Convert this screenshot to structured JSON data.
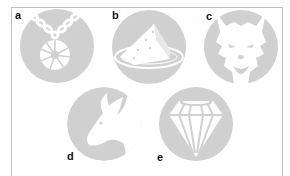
{
  "figure": {
    "circle_color": "#d0d0d0",
    "glyph_color": "#ffffff",
    "panels": [
      {
        "label": "a",
        "icon": "amulet-necklace-icon"
      },
      {
        "label": "b",
        "icon": "cheese-wedge-on-plate-icon"
      },
      {
        "label": "c",
        "icon": "werewolf-head-icon"
      },
      {
        "label": "d",
        "icon": "goat-head-icon"
      },
      {
        "label": "e",
        "icon": "diamond-gem-icon"
      }
    ]
  }
}
